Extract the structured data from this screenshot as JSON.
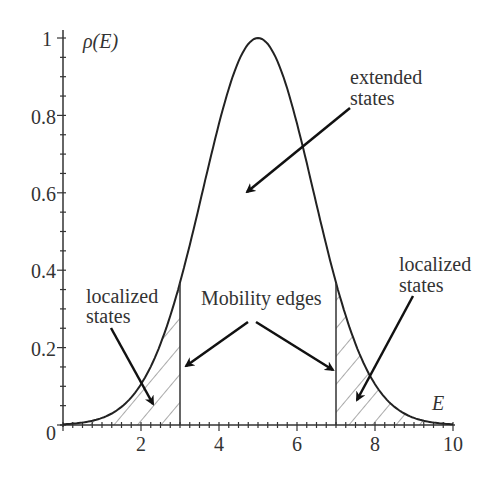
{
  "chart_data": {
    "type": "line",
    "title": "",
    "xlabel": "E",
    "ylabel": "ρ(E)",
    "xlim": [
      0,
      10
    ],
    "ylim": [
      0,
      1
    ],
    "x_ticks": [
      "2",
      "4",
      "6",
      "8",
      "10"
    ],
    "y_ticks": [
      "0",
      "0.2",
      "0.4",
      "0.6",
      "0.8",
      "1"
    ],
    "grid": false,
    "legend": null,
    "series": [
      {
        "name": "ρ(E) density of states",
        "function": "exp(-(E-5)^2/4)",
        "x": [
          0,
          0.5,
          1,
          1.5,
          2,
          2.5,
          3,
          3.5,
          4,
          4.5,
          5,
          5.5,
          6,
          6.5,
          7,
          7.5,
          8,
          8.5,
          9,
          9.5,
          10
        ],
        "values": [
          0.002,
          0.006,
          0.018,
          0.047,
          0.105,
          0.21,
          0.368,
          0.57,
          0.779,
          0.939,
          1.0,
          0.939,
          0.779,
          0.57,
          0.368,
          0.21,
          0.105,
          0.047,
          0.018,
          0.006,
          0.002
        ]
      }
    ],
    "mobility_edges": [
      3,
      7
    ],
    "shaded_regions": [
      {
        "from": 0,
        "to": 3,
        "pattern": "hatched",
        "meaning": "localized states"
      },
      {
        "from": 7,
        "to": 10,
        "pattern": "hatched",
        "meaning": "localized states"
      }
    ],
    "annotations": [
      {
        "text": "extended states",
        "arrow_to": [
          4.8,
          0.6
        ]
      },
      {
        "text": "Mobility edges",
        "arrow_to": [
          [
            3,
            0.15
          ],
          [
            7,
            0.15
          ]
        ]
      },
      {
        "text": "localized states",
        "position": "left",
        "arrow_to": [
          2.5,
          0.07
        ]
      },
      {
        "text": "localized states",
        "position": "right",
        "arrow_to": [
          7.4,
          0.07
        ]
      }
    ]
  },
  "labels": {
    "ylabel": "ρ(E)",
    "xlabel": "E",
    "extended_l1": "extended",
    "extended_l2": "states",
    "mobility": "Mobility edges",
    "loc_left_l1": "localized",
    "loc_left_l2": "states",
    "loc_right_l1": "localized",
    "loc_right_l2": "states",
    "xt2": "2",
    "xt4": "4",
    "xt6": "6",
    "xt8": "8",
    "xt10": "10",
    "yt0": "0",
    "yt02": "0.2",
    "yt04": "0.4",
    "yt06": "0.6",
    "yt08": "0.8",
    "yt1": "1"
  }
}
